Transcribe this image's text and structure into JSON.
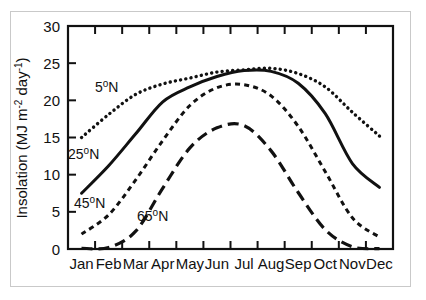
{
  "chart_data": {
    "type": "line",
    "title": "",
    "xlabel": "",
    "ylabel": "Insolation (MJ m-2 day-1)",
    "ylabel_parts": {
      "base": "Insolation (MJ m",
      "sup1": "-2",
      "mid": " day",
      "sup2": "-1",
      "close": ")"
    },
    "categories": [
      "Jan",
      "Feb",
      "Mar",
      "Apr",
      "May",
      "Jun",
      "Jul",
      "Aug",
      "Sep",
      "Oct",
      "Nov",
      "Dec"
    ],
    "x": [
      1,
      2,
      3,
      4,
      5,
      6,
      7,
      8,
      9,
      10,
      11,
      12
    ],
    "ylim": [
      0,
      30
    ],
    "yticks": [
      0,
      5,
      10,
      15,
      20,
      25,
      30
    ],
    "ytick_labels": [
      "0",
      "5",
      "10",
      "15",
      "20",
      "25",
      "30"
    ],
    "grid": false,
    "legend": "inline-annotations",
    "series": [
      {
        "name": "5 deg N",
        "label": "5",
        "label_sup": "o",
        "label_suffix": "N",
        "style": "dotted",
        "color": "#111111",
        "values": [
          15.0,
          18.1,
          20.8,
          22.2,
          23.0,
          23.8,
          24.1,
          24.3,
          23.6,
          21.8,
          18.4,
          15.2
        ]
      },
      {
        "name": "25 deg N",
        "label": "25",
        "label_sup": "o",
        "label_suffix": "N",
        "style": "solid",
        "color": "#111111",
        "values": [
          7.5,
          11.2,
          15.5,
          19.8,
          21.8,
          23.2,
          24.0,
          23.9,
          22.3,
          18.2,
          11.5,
          8.3
        ]
      },
      {
        "name": "45 deg N",
        "label": "45",
        "label_sup": "o",
        "label_suffix": "N",
        "style": "dashed",
        "color": "#111111",
        "values": [
          2.0,
          4.6,
          9.3,
          14.6,
          19.3,
          21.7,
          22.1,
          20.6,
          16.5,
          10.4,
          4.2,
          1.6
        ]
      },
      {
        "name": "65 deg N",
        "label": "65",
        "label_sup": "o",
        "label_suffix": "N",
        "style": "longdash",
        "color": "#111111",
        "values": [
          0.1,
          0.2,
          2.4,
          8.2,
          13.6,
          16.3,
          16.6,
          13.2,
          7.6,
          2.6,
          0.3,
          0.05
        ]
      }
    ],
    "annotations": [
      {
        "series": "5 deg N",
        "x_px": 95,
        "y_px": 92
      },
      {
        "series": "25 deg N",
        "x_px": 68,
        "y_px": 159
      },
      {
        "series": "45 deg N",
        "x_px": 74,
        "y_px": 208
      },
      {
        "series": "65 deg N",
        "x_px": 137,
        "y_px": 221
      }
    ]
  }
}
